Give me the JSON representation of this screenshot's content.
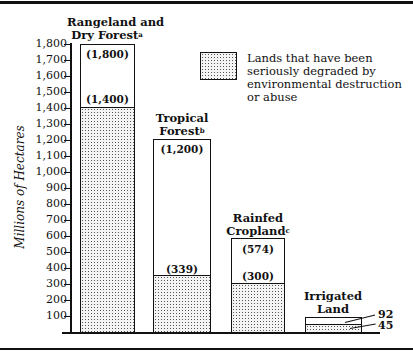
{
  "chart_data": {
    "type": "bar",
    "stacked_overlay": true,
    "title": "",
    "xlabel": "",
    "ylabel": "Millions of Hectares",
    "ylim": [
      0,
      1800
    ],
    "yticks": [
      100,
      200,
      300,
      400,
      500,
      600,
      700,
      800,
      900,
      1000,
      1100,
      1200,
      1300,
      1400,
      1500,
      1600,
      1700,
      1800
    ],
    "ytick_labels": [
      "100",
      "200",
      "300",
      "400",
      "500",
      "600",
      "700",
      "800",
      "900",
      "1,000",
      "1,100",
      "1,200",
      "1,300",
      "1,400",
      "1,500",
      "1,600",
      "1,700",
      "1,800"
    ],
    "grid": false,
    "legend_position": "upper right",
    "categories": [
      "Rangeland and Dry Forest",
      "Tropical Forest",
      "Rainfed Cropland",
      "Irrigated Land"
    ],
    "category_footnotes": [
      "a",
      "b",
      "c",
      ""
    ],
    "series": [
      {
        "name": "Total land",
        "values": [
          1800,
          1200,
          574,
          92
        ],
        "labels": [
          "(1,800)",
          "(1,200)",
          "(574)",
          "92"
        ]
      },
      {
        "name": "Lands that have been seriously degraded by environmental destruction or abuse",
        "values": [
          1400,
          339,
          300,
          45
        ],
        "labels": [
          "(1,400)",
          "(339)",
          "(300)",
          "45"
        ]
      }
    ]
  },
  "labels": {
    "cat0_line1": "Rangeland and",
    "cat0_line2": "Dry Forest",
    "cat0_fn": "a",
    "cat1_line1": "Tropical",
    "cat1_line2": "Forest",
    "cat1_fn": "b",
    "cat2_line1": "Rainfed",
    "cat2_line2": "Cropland",
    "cat2_fn": "c",
    "cat3_line1": "Irrigated",
    "cat3_line2": "Land",
    "total0": "(1,800)",
    "deg0": "(1,400)",
    "total1": "(1,200)",
    "deg1": "(339)",
    "total2": "(574)",
    "deg2": "(300)",
    "total3": "92",
    "deg3": "45",
    "ylabel": "Millions of Hectares",
    "legend": "Lands that have been seriously degraded by environmental destruction or abuse"
  },
  "ticks": [
    "1,800",
    "1,700",
    "1,600",
    "1,500",
    "1,400",
    "1,300",
    "1,200",
    "1,100",
    "1,000",
    "900",
    "800",
    "700",
    "600",
    "500",
    "400",
    "300",
    "200",
    "100"
  ]
}
